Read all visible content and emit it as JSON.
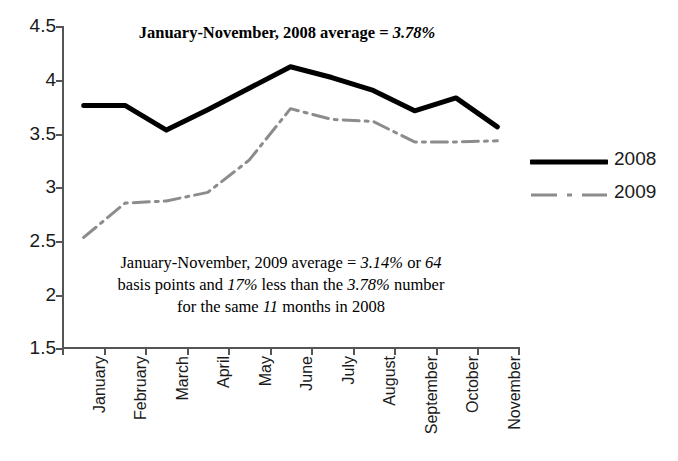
{
  "chart_data": {
    "type": "line",
    "title": "",
    "subtitle_prefix": "January-November, 2008 average = ",
    "subtitle_value": "3.78%",
    "xlabel": "",
    "ylabel": "",
    "ylim": [
      1.5,
      4.5
    ],
    "ytick_values": [
      4.5,
      4,
      3.5,
      3,
      2.5,
      2,
      1.5
    ],
    "ytick_labels": [
      "4.5",
      "4",
      "3.5",
      "3",
      "2.5",
      "2",
      "1.5"
    ],
    "grid": false,
    "legend_position": "right",
    "categories": [
      "January",
      "February",
      "March",
      "April",
      "May",
      "June",
      "July",
      "August",
      "September",
      "October",
      "November"
    ],
    "series": [
      {
        "name": "2008",
        "style": "solid",
        "color": "#000000",
        "width": 5,
        "values": [
          3.76,
          3.76,
          3.53,
          3.72,
          3.92,
          4.12,
          4.02,
          3.9,
          3.71,
          3.83,
          3.56
        ]
      },
      {
        "name": "2009",
        "style": "dash-dot",
        "color": "#8c8c8c",
        "width": 3,
        "values": [
          2.53,
          2.85,
          2.87,
          2.95,
          3.25,
          3.73,
          3.63,
          3.61,
          3.42,
          3.42,
          3.43
        ]
      }
    ],
    "annotation": {
      "line1_a": "January-November, 2009 average = ",
      "line1_v1": "3.14%",
      "line1_b": " or ",
      "line1_v2": "64",
      "line2_a": "basis points and ",
      "line2_v1": "17%",
      "line2_b": " less than the ",
      "line2_v2": "3.78%",
      "line2_c": " number",
      "line3_a": "for the same ",
      "line3_v1": "11",
      "line3_b": " months in 2008"
    }
  },
  "legend": {
    "items": [
      {
        "label": "2008"
      },
      {
        "label": "2009"
      }
    ]
  },
  "colors": {
    "series_2008": "#000000",
    "series_2009": "#8c8c8c",
    "axis": "#555555",
    "text": "#1a1a1a",
    "background": "#ffffff"
  }
}
